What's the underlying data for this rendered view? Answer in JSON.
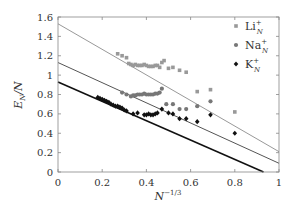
{
  "chart_data": {
    "type": "scatter",
    "title": "",
    "xlabel": "N^{-1/3}",
    "ylabel": "E_N/N",
    "xlim": [
      0,
      1
    ],
    "ylim": [
      0,
      1.6
    ],
    "xticks": [
      "0",
      "0.2",
      "0.4",
      "0.6",
      "0.8",
      "1"
    ],
    "yticks": [
      "0",
      "0.2",
      "0.4",
      "0.6",
      "0.8",
      "1",
      "1.2",
      "1.4",
      "1.6"
    ],
    "grid": false,
    "legend_position": "upper right",
    "series": [
      {
        "name": "Li_N^+",
        "label_main": "Li",
        "marker": "square",
        "color": "#999999",
        "x": [
          0.27,
          0.29,
          0.31,
          0.32,
          0.33,
          0.34,
          0.35,
          0.36,
          0.37,
          0.38,
          0.39,
          0.4,
          0.41,
          0.42,
          0.43,
          0.44,
          0.45,
          0.46,
          0.47,
          0.48,
          0.5,
          0.52,
          0.55,
          0.58,
          0.63,
          0.69,
          0.8
        ],
        "y": [
          1.22,
          1.2,
          1.18,
          1.12,
          1.11,
          1.1,
          1.11,
          1.1,
          1.1,
          1.1,
          1.11,
          1.1,
          1.09,
          1.09,
          1.09,
          1.1,
          1.1,
          1.08,
          1.13,
          1.15,
          1.07,
          1.08,
          1.05,
          1.03,
          0.83,
          0.85,
          0.62
        ]
      },
      {
        "name": "Na_N^+",
        "label_main": "Na",
        "marker": "circle",
        "color": "#777777",
        "x": [
          0.29,
          0.31,
          0.33,
          0.34,
          0.35,
          0.36,
          0.37,
          0.38,
          0.39,
          0.4,
          0.41,
          0.42,
          0.43,
          0.44,
          0.45,
          0.46,
          0.47,
          0.49,
          0.52,
          0.55,
          0.58,
          0.63,
          0.69
        ],
        "y": [
          0.82,
          0.8,
          0.78,
          0.79,
          0.79,
          0.8,
          0.8,
          0.8,
          0.81,
          0.8,
          0.8,
          0.8,
          0.8,
          0.81,
          0.81,
          0.82,
          0.86,
          0.7,
          0.7,
          0.65,
          0.65,
          0.68,
          0.73
        ]
      },
      {
        "name": "K_N^+",
        "label_main": "K",
        "marker": "diamond",
        "color": "#111111",
        "x": [
          0.18,
          0.19,
          0.2,
          0.21,
          0.22,
          0.23,
          0.24,
          0.25,
          0.26,
          0.27,
          0.28,
          0.29,
          0.3,
          0.31,
          0.34,
          0.36,
          0.39,
          0.4,
          0.41,
          0.42,
          0.43,
          0.44,
          0.45,
          0.47,
          0.5,
          0.52,
          0.55,
          0.58,
          0.63,
          0.69,
          0.8
        ],
        "y": [
          0.77,
          0.76,
          0.75,
          0.74,
          0.73,
          0.72,
          0.7,
          0.69,
          0.68,
          0.68,
          0.67,
          0.66,
          0.64,
          0.63,
          0.6,
          0.61,
          0.59,
          0.59,
          0.6,
          0.59,
          0.59,
          0.6,
          0.61,
          0.65,
          0.61,
          0.6,
          0.55,
          0.55,
          0.52,
          0.59,
          0.4
        ]
      }
    ],
    "fit_lines": [
      {
        "name": "Li fit",
        "color": "#999999",
        "width": 1,
        "x": [
          0,
          1
        ],
        "y": [
          1.53,
          0.21
        ]
      },
      {
        "name": "Na fit",
        "color": "#555555",
        "width": 1,
        "x": [
          0,
          1
        ],
        "y": [
          1.13,
          0.09
        ]
      },
      {
        "name": "K fit",
        "color": "#111111",
        "width": 1.6,
        "x": [
          0,
          0.93
        ],
        "y": [
          0.93,
          0.0
        ]
      }
    ]
  }
}
